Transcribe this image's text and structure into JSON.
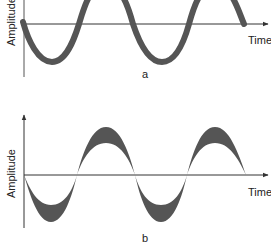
{
  "colors": {
    "wave": "#555555",
    "axis": "#333333",
    "text": "#222222",
    "background": "#ffffff"
  },
  "diagrams": [
    {
      "id": "a",
      "caption": "a",
      "y_label": "Amplitude",
      "x_label": "Time",
      "description": "Sine wave with constant thick line width"
    },
    {
      "id": "b",
      "caption": "b",
      "y_label": "Amplitude",
      "x_label": "Time",
      "description": "Sine wave with line thickness varying along the wave (thick at peaks and troughs, thin at zero crossings)"
    }
  ]
}
